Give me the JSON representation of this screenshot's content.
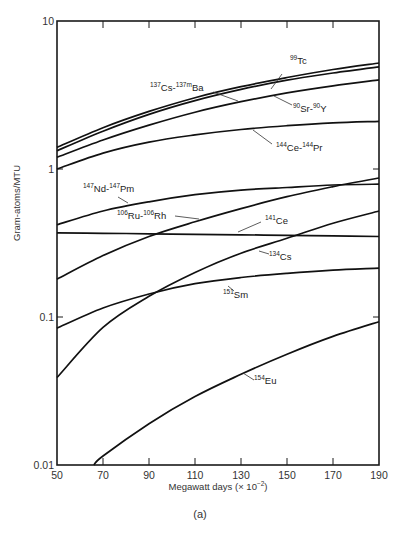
{
  "header_fragment": "",
  "caption": "(a)",
  "chart_data": {
    "type": "line",
    "title": "",
    "xlabel": "Megawatt days (× 10⁻²)",
    "xlabel_base": "Megawatt days (× 10",
    "xlabel_exp": "−2",
    "xlabel_tail": ")",
    "ylabel": "Gram-atoms/MTU",
    "xscale": "linear",
    "yscale": "log",
    "xlim": [
      50,
      190
    ],
    "ylim": [
      0.01,
      10
    ],
    "xticks": [
      50,
      70,
      90,
      110,
      130,
      150,
      170,
      190
    ],
    "yticks": [
      0.01,
      0.1,
      1,
      10
    ],
    "ytick_labels": [
      "0.01",
      "0.1",
      "1",
      "10"
    ],
    "grid": false,
    "legend": "inline labels",
    "series": [
      {
        "name": "99Tc",
        "label_parts": [
          [
            "99",
            "Tc"
          ]
        ],
        "x": [
          50,
          70,
          90,
          110,
          130,
          150,
          170,
          190
        ],
        "values": [
          1.4,
          1.9,
          2.45,
          3.03,
          3.6,
          4.15,
          4.7,
          5.2
        ],
        "label_pos": [
          290,
          64
        ],
        "leader": [
          [
            282,
            74
          ],
          [
            271,
            89
          ]
        ]
      },
      {
        "name": "137Cs-137mBa",
        "label_parts": [
          [
            "137",
            "Cs-"
          ],
          [
            "137m",
            "Ba"
          ]
        ],
        "x": [
          50,
          70,
          90,
          110,
          130,
          150,
          170,
          190
        ],
        "values": [
          1.33,
          1.8,
          2.34,
          2.9,
          3.45,
          3.98,
          4.45,
          4.9
        ],
        "label_pos": [
          150,
          91
        ],
        "leader": [
          [
            213,
            92
          ],
          [
            238,
            101
          ]
        ]
      },
      {
        "name": "90Sr-90Y",
        "label_parts": [
          [
            "90",
            "Sr-"
          ],
          [
            "90",
            "Y"
          ]
        ],
        "x": [
          50,
          70,
          90,
          110,
          130,
          150,
          170,
          190
        ],
        "values": [
          1.2,
          1.57,
          1.98,
          2.42,
          2.85,
          3.27,
          3.65,
          4.0
        ],
        "label_pos": [
          293,
          112
        ],
        "leader": [
          [
            274,
            96
          ],
          [
            292,
            105
          ]
        ]
      },
      {
        "name": "144Ce-144Pr",
        "label_parts": [
          [
            "144",
            "Ce-"
          ],
          [
            "144",
            "Pr"
          ]
        ],
        "x": [
          50,
          70,
          90,
          110,
          130,
          150,
          170,
          190
        ],
        "values": [
          1.0,
          1.28,
          1.52,
          1.7,
          1.85,
          1.96,
          2.05,
          2.1
        ],
        "label_pos": [
          276,
          151
        ],
        "leader": [
          [
            253,
            130
          ],
          [
            272,
            144
          ]
        ]
      },
      {
        "name": "147Nd-147Pm",
        "label_parts": [
          [
            "147",
            "Nd-"
          ],
          [
            "147",
            "Pm"
          ]
        ],
        "x": [
          50,
          70,
          90,
          110,
          130,
          150,
          170,
          190
        ],
        "values": [
          0.42,
          0.52,
          0.6,
          0.67,
          0.72,
          0.75,
          0.78,
          0.79
        ],
        "label_pos": [
          83,
          192
        ],
        "leader": [
          [
            118,
            197
          ],
          [
            128,
            203
          ]
        ]
      },
      {
        "name": "106Ru-106Rh",
        "label_parts": [
          [
            "106",
            "Ru-"
          ],
          [
            "106",
            "Rh"
          ]
        ],
        "x": [
          50,
          70,
          90,
          110,
          130,
          150,
          170,
          190
        ],
        "values": [
          0.18,
          0.26,
          0.35,
          0.44,
          0.54,
          0.65,
          0.76,
          0.87
        ],
        "label_pos": [
          117,
          219
        ],
        "leader": [
          [
            175,
            216
          ],
          [
            199,
            219
          ]
        ]
      },
      {
        "name": "141Ce",
        "label_parts": [
          [
            "141",
            "Ce"
          ]
        ],
        "x": [
          50,
          70,
          90,
          110,
          130,
          150,
          170,
          190
        ],
        "values": [
          0.37,
          0.368,
          0.365,
          0.362,
          0.359,
          0.356,
          0.353,
          0.35
        ],
        "label_pos": [
          265,
          224
        ],
        "leader": [
          [
            238,
            232
          ],
          [
            261,
            222
          ]
        ]
      },
      {
        "name": "134Cs",
        "label_parts": [
          [
            "134",
            "Cs"
          ]
        ],
        "x": [
          50,
          70,
          90,
          110,
          130,
          150,
          170,
          190
        ],
        "values": [
          0.039,
          0.085,
          0.138,
          0.2,
          0.27,
          0.34,
          0.43,
          0.52
        ],
        "label_pos": [
          269,
          260
        ],
        "leader": [
          [
            259,
            251
          ],
          [
            269,
            254
          ]
        ]
      },
      {
        "name": "151Sm",
        "label_parts": [
          [
            "151",
            "Sm"
          ]
        ],
        "x": [
          50,
          70,
          90,
          110,
          130,
          150,
          170,
          190
        ],
        "values": [
          0.084,
          0.115,
          0.143,
          0.168,
          0.185,
          0.197,
          0.207,
          0.214
        ],
        "label_pos": [
          223,
          298
        ],
        "leader": [
          [
            228,
            286
          ],
          [
            234,
            291
          ]
        ]
      },
      {
        "name": "154Eu",
        "label_parts": [
          [
            "154",
            "Eu"
          ]
        ],
        "x": [
          66,
          70,
          90,
          110,
          130,
          150,
          170,
          190
        ],
        "values": [
          0.01,
          0.0115,
          0.019,
          0.029,
          0.041,
          0.056,
          0.074,
          0.093
        ],
        "label_pos": [
          254,
          384
        ],
        "leader": [
          [
            243,
            373
          ],
          [
            254,
            380
          ]
        ]
      }
    ]
  }
}
